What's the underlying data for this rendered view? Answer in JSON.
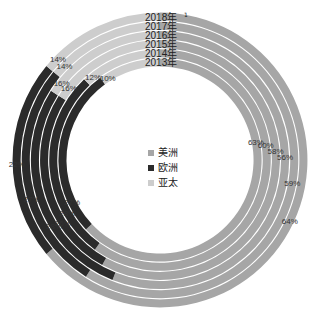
{
  "chart_data": {
    "type": "donut",
    "title": "",
    "layout": "concentric-rings (outer = 2018, inner = 2013), clockwise from 12 o'clock",
    "categories": [
      "2013年",
      "2014年",
      "2015年",
      "2016年",
      "2017年",
      "2018年"
    ],
    "category_footnote": {
      "2018年": "1"
    },
    "series": [
      {
        "name": "美洲",
        "color": "#a6a6a6",
        "values": [
          63,
          60,
          58,
          56,
          59,
          64
        ]
      },
      {
        "name": "欧洲",
        "color": "#2b2b2b",
        "values": [
          27,
          28,
          26,
          28,
          27,
          22
        ]
      },
      {
        "name": "亚太",
        "color": "#cdcdcd",
        "values": [
          10,
          12,
          16,
          16,
          14,
          14
        ]
      }
    ],
    "legend": {
      "position": "center",
      "entries": [
        "美洲",
        "欧洲",
        "亚太"
      ]
    },
    "units": "%"
  },
  "labels": {
    "years": [
      "2018年",
      "2017年",
      "2016年",
      "2015年",
      "2014年",
      "2013年"
    ],
    "footnote_mark": "1"
  }
}
